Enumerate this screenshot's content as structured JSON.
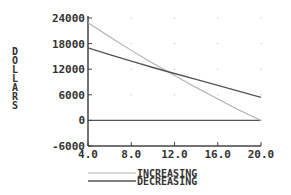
{
  "chart_data": {
    "type": "line",
    "title": "",
    "xlabel": "",
    "ylabel": "DOLLARS",
    "xlim": [
      4.0,
      20.0
    ],
    "ylim": [
      -6000,
      24000
    ],
    "xticks": [
      "4.0",
      "8.0",
      "12.0",
      "16.0",
      "20.0"
    ],
    "yticks": [
      "24000",
      "18000",
      "12000",
      "6000",
      "0",
      "-6000"
    ],
    "xtick_values": [
      4,
      8,
      12,
      16,
      20
    ],
    "ytick_values": [
      24000,
      18000,
      12000,
      6000,
      0,
      -6000
    ],
    "grid": "dots",
    "legend_position": "bottom",
    "series": [
      {
        "name": "INCREASING",
        "color": "#b0b0b0",
        "x": [
          4,
          6,
          8,
          10,
          12,
          14,
          16,
          18,
          20
        ],
        "y": [
          22900,
          19600,
          16400,
          13400,
          10500,
          7700,
          5000,
          2400,
          0
        ]
      },
      {
        "name": "DECREASING",
        "color": "#555555",
        "x": [
          4,
          6,
          8,
          10,
          12,
          14,
          16,
          18,
          20
        ],
        "y": [
          17000,
          15400,
          13900,
          12400,
          11000,
          9600,
          8200,
          6800,
          5400
        ]
      }
    ],
    "reference_line": {
      "y": 0
    }
  }
}
